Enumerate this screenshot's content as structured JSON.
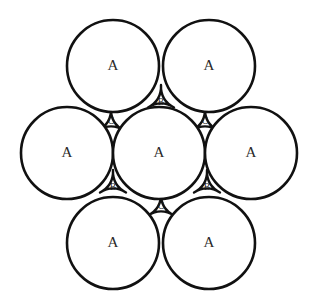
{
  "diagram": {
    "background_color": "#ffffff",
    "stroke_color": "#111111",
    "label_color": "#2a2a2a",
    "circle_radius": 46,
    "circle_fill": "#ffffff",
    "circles": [
      {
        "id": "circle-top-left",
        "label": "A",
        "cx": 113,
        "cy": 66,
        "r": 46
      },
      {
        "id": "circle-top-right",
        "label": "A",
        "cx": 209,
        "cy": 66,
        "r": 46
      },
      {
        "id": "circle-middle-left",
        "label": "A",
        "cx": 67,
        "cy": 153,
        "r": 46
      },
      {
        "id": "circle-center",
        "label": "A",
        "cx": 159,
        "cy": 153,
        "r": 46
      },
      {
        "id": "circle-middle-right",
        "label": "A",
        "cx": 251,
        "cy": 153,
        "r": 46
      },
      {
        "id": "circle-bottom-left",
        "label": "A",
        "cx": 113,
        "cy": 243,
        "r": 46
      },
      {
        "id": "circle-bottom-right",
        "label": "A",
        "cx": 209,
        "cy": 243,
        "r": 46
      }
    ],
    "interstices": [
      {
        "id": "interstice-top-center",
        "label": "B",
        "cx": 161,
        "cy": 100,
        "orientation": "up",
        "size": 15
      },
      {
        "id": "interstice-upper-left",
        "label": "C",
        "cx": 111,
        "cy": 123,
        "orientation": "down",
        "size": 15
      },
      {
        "id": "interstice-upper-right",
        "label": "C",
        "cx": 205,
        "cy": 123,
        "orientation": "down",
        "size": 15
      },
      {
        "id": "interstice-lower-left",
        "label": "B",
        "cx": 113,
        "cy": 185,
        "orientation": "up",
        "size": 15
      },
      {
        "id": "interstice-lower-right",
        "label": "B",
        "cx": 207,
        "cy": 185,
        "orientation": "up",
        "size": 15
      },
      {
        "id": "interstice-bottom-center",
        "label": "C",
        "cx": 161,
        "cy": 208,
        "orientation": "down",
        "size": 15
      }
    ],
    "legend": {
      "sphere_label": "A",
      "interstitial_b_label": "B",
      "interstitial_c_label": "C"
    }
  }
}
